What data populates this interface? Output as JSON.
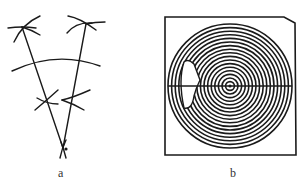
{
  "figure": {
    "panels": [
      {
        "id": "a",
        "caption": "a",
        "description": "Geometric construction: two lines converging to a bottom vertex, a central arc crossing both lines, and compass-arc intersection marks"
      },
      {
        "id": "b",
        "caption": "b",
        "description": "Square frame enclosing concentric circles with a horizontal diameter line and a cutout on the left side",
        "ring_count": 17
      }
    ],
    "colors": {
      "ink": "#1a1a1a",
      "background": "#ffffff"
    }
  }
}
